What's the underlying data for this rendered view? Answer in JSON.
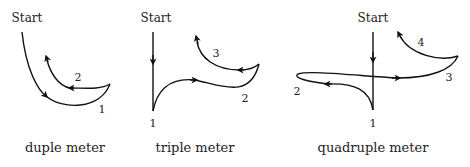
{
  "diagrams": [
    {
      "start_label": "Start",
      "caption": "duple meter",
      "beats": [
        "1",
        "2"
      ]
    },
    {
      "start_label": "Start",
      "caption": "triple meter",
      "beats": [
        "1",
        "2",
        "3"
      ]
    },
    {
      "start_label": "Start",
      "caption": "quadruple meter",
      "beats": [
        "1",
        "2",
        "3",
        "4"
      ]
    }
  ],
  "colors": {
    "stroke": "#111111",
    "text": "#222222",
    "background": "#ffffff"
  }
}
